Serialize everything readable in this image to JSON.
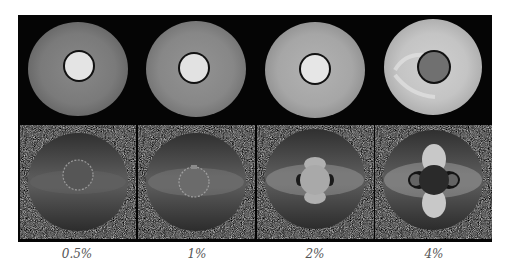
{
  "figure": {
    "rows": [
      {
        "name": "magnitude-images",
        "description": "Magnitude images of cylindrical phantom with central inclusion"
      },
      {
        "name": "phase-images",
        "description": "Phase images showing susceptibility-induced field perturbation"
      }
    ],
    "columns": [
      {
        "label": "0.5%",
        "inner_gray": "#e4e4e4",
        "outer_gray": "#7c7c7c",
        "phase_lobe": 0.0
      },
      {
        "label": "1%",
        "inner_gray": "#e2e2e2",
        "outer_gray": "#8a8a8a",
        "phase_lobe": 0.35
      },
      {
        "label": "2%",
        "inner_gray": "#e6e6e6",
        "outer_gray": "#a8a8a8",
        "phase_lobe": 0.65
      },
      {
        "label": "4%",
        "inner_gray": "#707070",
        "outer_gray": "#c4c4c4",
        "phase_lobe": 1.0
      }
    ],
    "colors": {
      "frame": "#050505",
      "phase_background": "#3e3e3e",
      "label_text": "#555555"
    }
  }
}
